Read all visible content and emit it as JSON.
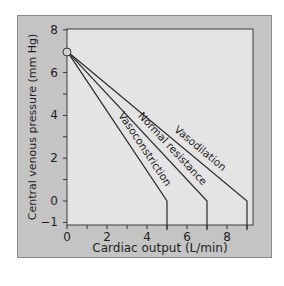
{
  "chart_data": {
    "type": "line",
    "title": "",
    "xlabel": "Cardiac output (L/min)",
    "ylabel": "Central venous pressure (mm Hg)",
    "xlim": [
      0,
      9.5
    ],
    "ylim": [
      -1,
      8
    ],
    "xticks": [
      0,
      2,
      4,
      6,
      8
    ],
    "xtick_labels": [
      "0",
      "2",
      "4",
      "6",
      "8"
    ],
    "yticks": [
      -1,
      0,
      2,
      4,
      6,
      8
    ],
    "ytick_labels": [
      "−1",
      "0",
      "2",
      "4",
      "6",
      "8"
    ],
    "grid": false,
    "legend": "none (inline line labels)",
    "origin_point": {
      "x": 0,
      "y": 7
    },
    "series": [
      {
        "name": "Vasoconstriction",
        "x": [
          0,
          5,
          5
        ],
        "y": [
          7,
          0,
          -1
        ]
      },
      {
        "name": "Normal resistance",
        "x": [
          0,
          7,
          7
        ],
        "y": [
          7,
          0,
          -1
        ]
      },
      {
        "name": "Vasodilation",
        "x": [
          0,
          9,
          9
        ],
        "y": [
          7,
          0,
          -1
        ]
      }
    ],
    "colors": {
      "panel": "#c4c4c4",
      "plot_bg": "#e4e4e4",
      "line": "#2a2a2a",
      "text": "#1e1e1e"
    }
  }
}
